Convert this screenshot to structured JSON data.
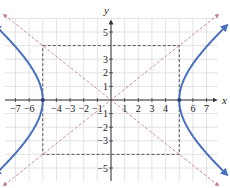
{
  "chart_data": {
    "type": "line",
    "title": "",
    "xlabel": "x",
    "ylabel": "y",
    "xlim": [
      -7.8,
      7.8
    ],
    "ylim": [
      -6,
      6
    ],
    "grid": true,
    "x_ticks": [
      -7,
      -6,
      -4,
      -3,
      -2,
      -1,
      1,
      2,
      3,
      4,
      6,
      7
    ],
    "y_ticks": [
      5,
      3,
      2,
      1,
      -1,
      -2,
      -3,
      -5
    ],
    "x_tick_labels": [
      "−7",
      "−6",
      "−4",
      "−3",
      "−2",
      "−1",
      "1",
      "2",
      "3",
      "4",
      "6",
      "7"
    ],
    "y_tick_labels": [
      "5",
      "3",
      "2",
      "1",
      "−1",
      "−2",
      "−3",
      "−5"
    ],
    "series": [
      {
        "name": "hyperbola",
        "equation": "x^2/25 - y^2/16 = 1",
        "vertices": [
          [
            -5,
            0
          ],
          [
            5,
            0
          ]
        ],
        "color": "#4a6fc0",
        "style": "solid"
      },
      {
        "name": "asymptote-positive",
        "equation": "y = (4/5)x",
        "color": "#c97a8a",
        "style": "dashed"
      },
      {
        "name": "asymptote-negative",
        "equation": "y = -(4/5)x",
        "color": "#c97a8a",
        "style": "dashed"
      },
      {
        "name": "central-rectangle",
        "corners": [
          [
            -5,
            4
          ],
          [
            5,
            4
          ],
          [
            5,
            -4
          ],
          [
            -5,
            -4
          ]
        ],
        "color": "#444444",
        "style": "dashed"
      }
    ]
  },
  "labels": {
    "x_axis": "x",
    "y_axis": "y"
  },
  "colors": {
    "curve": "#4a6fc0",
    "asymptote": "#c97a8a",
    "rectangle": "#444444",
    "grid": "#dcdcdc",
    "axis": "#333333"
  }
}
